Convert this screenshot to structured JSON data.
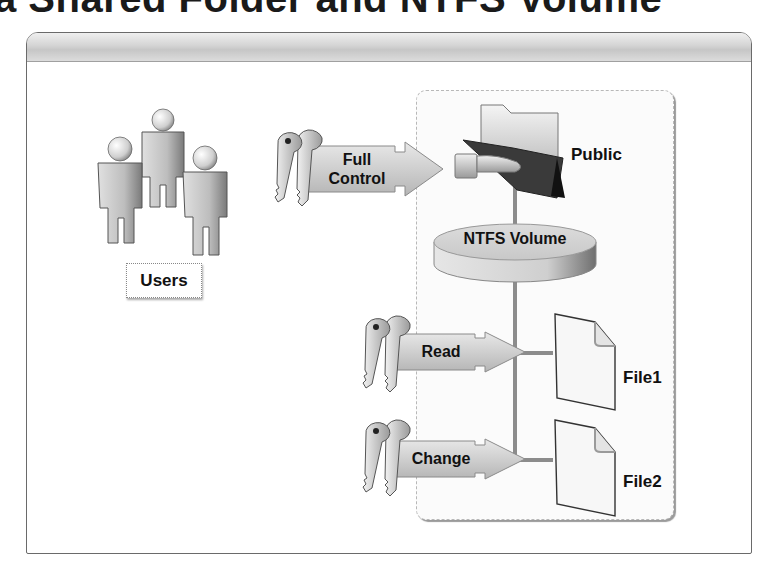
{
  "title": "a Shared Folder and NTFS Volume",
  "users": {
    "label": "Users",
    "icon": "users-group-icon",
    "count": 3
  },
  "permissions": [
    {
      "label_line1": "Full",
      "label_line2": "Control",
      "target": "Public",
      "icon": "keys-icon"
    },
    {
      "label_line1": "Read",
      "label_line2": "",
      "target": "File1",
      "icon": "keys-icon"
    },
    {
      "label_line1": "Change",
      "label_line2": "",
      "target": "File2",
      "icon": "keys-icon"
    }
  ],
  "shared_folder": {
    "label": "Public",
    "icon": "shared-folder-icon"
  },
  "volume": {
    "label": "NTFS Volume",
    "icon": "disk-volume-icon"
  },
  "files": [
    {
      "label": "File1",
      "icon": "file-icon"
    },
    {
      "label": "File2",
      "icon": "file-icon"
    }
  ],
  "colors": {
    "frame_border": "#6a6a6a",
    "header_band": "#cfcfcf",
    "connector": "#8c8c8c",
    "arrow_fill": "#d0d0d0",
    "figure_fill": "#c8c8c8"
  }
}
